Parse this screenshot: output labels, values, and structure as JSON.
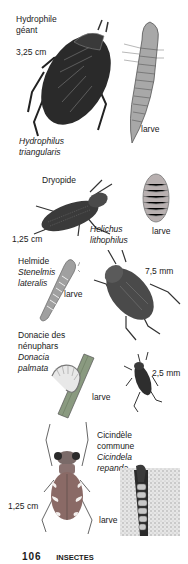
{
  "page": {
    "number": "106",
    "section": "INSECTES"
  },
  "entries": [
    {
      "common_name": [
        "Hydrophile",
        "géant"
      ],
      "scientific_name": [
        "Hydrophilus",
        "triangularis"
      ],
      "size": "3,25 cm",
      "larva_label": "larve"
    },
    {
      "common_name": [
        "Dryopide"
      ],
      "scientific_name": [
        "Helichus",
        "lithophilus"
      ],
      "size": "1,25 cm",
      "larva_label": "larve"
    },
    {
      "common_name": [
        "Helmide"
      ],
      "scientific_name": [
        "Stenelmis",
        "lateralis"
      ],
      "size": "7,5 mm",
      "larva_label": "larve"
    },
    {
      "common_name": [
        "Donacie des",
        "nénuphars"
      ],
      "scientific_name": [
        "Donacia",
        "palmata"
      ],
      "size": "2,5 mm",
      "larva_label": "larve"
    },
    {
      "common_name": [
        "Cicindèle",
        "commune"
      ],
      "scientific_name": [
        "Cicindela",
        "repanda"
      ],
      "size": "1,25 cm",
      "larva_label": "larve"
    }
  ],
  "colors": {
    "ink": "#1a1a1a",
    "beetle_dark": "#2a2a2a",
    "larva_gray": "#9a9a9a",
    "plant_green": "#8a9a80"
  }
}
